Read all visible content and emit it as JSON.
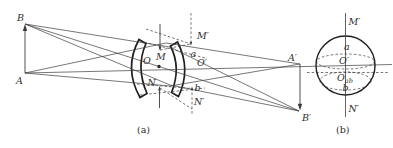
{
  "colors": {
    "background": "#ffffff",
    "line": "#3c3c3c",
    "lens_outline": "#1e1e1e",
    "text": "#2f2f2f"
  },
  "figure_a": {
    "caption": "(a)",
    "labels": {
      "object_top": "B",
      "object_base": "A",
      "lens_center": "O",
      "stop_top": "M",
      "stop_bottom": "N",
      "pupil_top_point": "a",
      "exit_pupil_center": "O′",
      "pupil_bottom_point": "b",
      "stop_image_top": "M′",
      "stop_image_bottom": "N′",
      "image_axis_point": "A′",
      "image_off_axis_point": "B′"
    }
  },
  "figure_b": {
    "caption": "(b)",
    "labels": {
      "top": "M′",
      "upper_point": "a",
      "center": "O′",
      "center_ab_main": "O",
      "center_ab_sub": "ab",
      "lower_point": "b",
      "bottom": "N′"
    }
  }
}
